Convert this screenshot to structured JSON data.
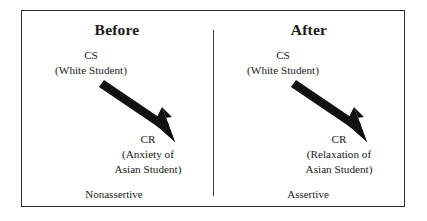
{
  "figure": {
    "name": "classical-conditioning-before-after-diagram",
    "frame_color": "#2b2b2b",
    "background_color": "#ffffff",
    "arrow_color": "#111111"
  },
  "panels": [
    {
      "id": "before",
      "title": "Before",
      "stimulus_label": "CS",
      "stimulus_detail": "(White Student)",
      "response_label": "CR",
      "response_detail_line1": "(Anxiety of",
      "response_detail_line2": "Asian Student)",
      "outcome_label": "Nonassertive",
      "arrow": "down-right-thick-arrow"
    },
    {
      "id": "after",
      "title": "After",
      "stimulus_label": "CS",
      "stimulus_detail": "(White Student)",
      "response_label": "CR",
      "response_detail_line1": "(Relaxation of",
      "response_detail_line2": "Asian Student)",
      "outcome_label": "Assertive",
      "arrow": "down-right-thick-arrow"
    }
  ]
}
